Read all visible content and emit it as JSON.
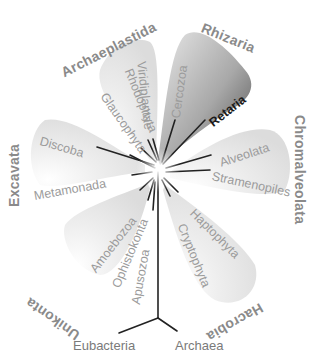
{
  "diagram": {
    "type": "unrooted-radial-phylogenetic-tree",
    "colors": {
      "background": "#ffffff",
      "shade_light": "#e6e6e6",
      "shade_rhizaria_light": "#d0d0d0",
      "shade_rhizaria_dark": "#555555",
      "branch": "#222222",
      "group_label": "#8a8a8a",
      "clade_label": "#9b9b9b",
      "highlight_label": "#1a1a1a"
    },
    "supergroups": [
      {
        "name": "Archaeplastida",
        "clades": [
          "Glaucophyta",
          "Rhodophyta",
          "Viridiplantae"
        ]
      },
      {
        "name": "Rhizaria",
        "clades": [
          "Cercozoa",
          "Retaria"
        ]
      },
      {
        "name": "Chromalveolata",
        "clades": [
          "Alveolata",
          "Stramenopiles"
        ]
      },
      {
        "name": "Hacrobia",
        "clades": [
          "Haptophyta",
          "Cryptophyta"
        ]
      },
      {
        "name": "Unikonta",
        "clades": [
          "Amoebozoa",
          "Ophistokonta",
          "Apusozoa"
        ]
      },
      {
        "name": "Excavata",
        "clades": [
          "Discoba",
          "Metamonada"
        ]
      }
    ],
    "root": {
      "left": "Eubacteria",
      "right": "Archaea"
    }
  },
  "labels": {
    "archaeplastida": "Archaeplastida",
    "rhizaria": "Rhizaria",
    "chromalveolata": "Chromalveolata",
    "hacrobia": "Hacrobia",
    "unikonta": "Unikonta",
    "excavata": "Excavata",
    "glaucophyta": "Glaucophyta",
    "rhodophyta": "Rhodophyta",
    "viridiplantae": "Viridiplantae",
    "cercozoa": "Cercozoa",
    "retaria": "Retaria",
    "alveolata": "Alveolata",
    "stramenopiles": "Stramenopiles",
    "haptophyta": "Haptophyta",
    "cryptophyta": "Cryptophyta",
    "amoebozoa": "Amoebozoa",
    "ophistokonta": "Ophistokonta",
    "apusozoa": "Apusozoa",
    "discoba": "Discoba",
    "metamonada": "Metamonada",
    "eubacteria": "Eubacteria",
    "archaea": "Archaea"
  }
}
